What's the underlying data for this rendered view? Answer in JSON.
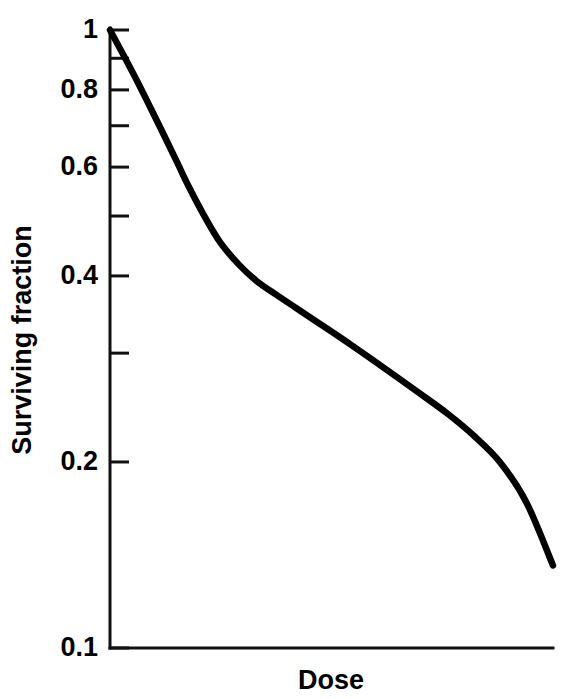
{
  "figure": {
    "background_color": "#ffffff",
    "ink_color": "#000000"
  },
  "chart_data": {
    "type": "line",
    "title": "",
    "subtitle": "",
    "xlabel": "Dose",
    "ylabel": "Surviving fraction",
    "yscale": "log",
    "xscale": "linear",
    "ylim": [
      0.1,
      1.0
    ],
    "xlim": [
      0,
      1
    ],
    "grid": false,
    "legend": null,
    "legend_position": "none",
    "x_tick_labels": [],
    "x_ticks_visible": false,
    "y_tick_labels": [
      "1",
      "0.8",
      "0.6",
      "0.4",
      "0.2",
      "0.1"
    ],
    "y_tick_values": [
      1.0,
      0.8,
      0.6,
      0.4,
      0.2,
      0.1
    ],
    "y_minor_tick_values": [
      0.9,
      0.7,
      0.5,
      0.3
    ],
    "annotations": [],
    "series": [
      {
        "name": "cell survival curve",
        "color": "#000000",
        "linewidth": 6.5,
        "x": [
          0.0,
          0.03,
          0.06,
          0.09,
          0.12,
          0.15,
          0.18,
          0.215,
          0.25,
          0.29,
          0.33,
          0.375,
          0.42,
          0.47,
          0.52,
          0.58,
          0.64,
          0.7,
          0.76,
          0.82,
          0.88,
          0.94,
          1.0
        ],
        "y": [
          1.0,
          0.912,
          0.83,
          0.752,
          0.68,
          0.614,
          0.554,
          0.497,
          0.452,
          0.418,
          0.393,
          0.373,
          0.355,
          0.336,
          0.318,
          0.297,
          0.277,
          0.258,
          0.24,
          0.221,
          0.2,
          0.172,
          0.136
        ]
      }
    ]
  },
  "axes": {
    "y_axis_label": "Surviving fraction",
    "x_axis_label": "Dose",
    "y_top_label": "1",
    "y_bottom_label": "0.1"
  }
}
